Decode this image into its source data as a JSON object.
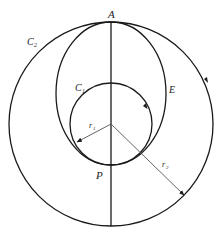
{
  "diagram": {
    "labels": {
      "A": "A",
      "P": "P",
      "E": "E",
      "C1": "C",
      "C1_sub": "1",
      "C2": "C",
      "C2_sub": "2",
      "r1": "r",
      "r1_sub": "1",
      "r2": "r",
      "r2_sub": "2"
    },
    "colors": {
      "stroke": "#1a1a1a",
      "radius_line": "#555555"
    }
  }
}
